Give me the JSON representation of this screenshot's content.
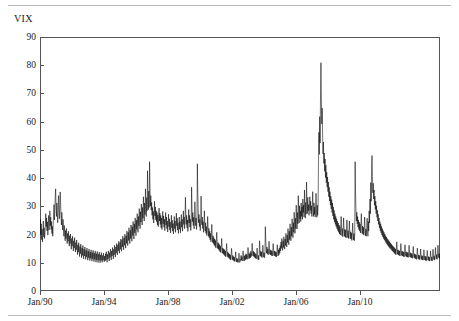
{
  "figure": {
    "series_label": "VIX",
    "line_color": "#000000",
    "frame_color": "#555555",
    "rule_color": "#b9b9b9",
    "background": "#ffffff"
  },
  "chart_data": {
    "type": "line",
    "title": "",
    "subtitle": "",
    "xlabel": "",
    "ylabel": "VIX",
    "legend": [
      "VIX"
    ],
    "legend_position": "above-left",
    "grid": false,
    "ylim": [
      0,
      90
    ],
    "y_ticks": [
      0,
      10,
      20,
      30,
      40,
      50,
      60,
      70,
      80,
      90
    ],
    "y_tick_labels": [
      "0",
      "10",
      "20",
      "30",
      "40",
      "50",
      "60",
      "70",
      "80",
      "90"
    ],
    "xlim": [
      "Jan/90",
      "Dec/14"
    ],
    "x_ticks": [
      "Jan/90",
      "Jan/94",
      "Jan/98",
      "Jan/02",
      "Jan/06",
      "Jan/10"
    ],
    "x_tick_labels": [
      "Jan/90",
      "Jan/94",
      "Jan/98",
      "Jan/02",
      "Jan/06",
      "Jan/10"
    ],
    "x_tick_fractions": [
      0.0,
      0.16,
      0.32,
      0.48,
      0.64,
      0.8
    ],
    "x_start_year": 1990,
    "x_end_year": 2015,
    "series": [
      {
        "name": "VIX",
        "color": "#000000",
        "values": [
          22.2,
          25.4,
          19.6,
          23.8,
          18.2,
          21.9,
          17.4,
          20.6,
          24.8,
          19.2,
          22.4,
          18.6,
          20.1,
          23.6,
          27.4,
          22.8,
          25.9,
          21.3,
          24.5,
          19.8,
          23.2,
          26.8,
          21.6,
          24.1,
          28.4,
          23.1,
          26.2,
          21.8,
          24.6,
          20.3,
          22.9,
          19.4,
          23.5,
          27.1,
          30.6,
          25.2,
          28.8,
          33.4,
          36.2,
          30.1,
          26.4,
          31.2,
          27.8,
          24.2,
          28.6,
          33.8,
          29.4,
          25.6,
          30.2,
          35.1,
          31.4,
          26.8,
          23.4,
          27.9,
          24.2,
          21.6,
          25.4,
          22.1,
          19.4,
          23.2,
          20.6,
          17.8,
          21.4,
          18.6,
          22.2,
          19.2,
          16.8,
          20.4,
          17.6,
          21.2,
          18.4,
          15.9,
          19.6,
          16.8,
          20.2,
          17.4,
          14.8,
          18.6,
          15.9,
          19.4,
          16.6,
          14.2,
          17.8,
          15.2,
          18.9,
          16.1,
          13.8,
          17.2,
          14.6,
          18.1,
          15.4,
          12.9,
          16.4,
          13.8,
          17.1,
          14.4,
          12.2,
          15.8,
          13.2,
          16.6,
          14.1,
          11.8,
          15.2,
          12.6,
          16.1,
          13.6,
          11.4,
          14.8,
          12.4,
          15.6,
          13.2,
          11.2,
          14.4,
          12.1,
          15.2,
          12.8,
          10.9,
          14.1,
          11.8,
          14.9,
          12.6,
          10.8,
          13.8,
          11.6,
          14.6,
          12.4,
          10.6,
          13.6,
          11.4,
          14.4,
          12.2,
          10.4,
          13.4,
          11.2,
          14.2,
          12.0,
          10.2,
          13.2,
          11.0,
          14.0,
          11.8,
          10.1,
          13.0,
          10.9,
          13.8,
          11.6,
          10.0,
          12.8,
          10.8,
          13.6,
          11.4,
          10.2,
          12.6,
          10.9,
          13.4,
          11.2,
          10.4,
          12.4,
          10.6,
          13.2,
          11.0,
          13.9,
          11.8,
          10.2,
          13.0,
          11.4,
          14.2,
          12.1,
          10.6,
          13.6,
          11.9,
          14.8,
          12.6,
          11.0,
          14.2,
          12.4,
          15.4,
          13.1,
          11.4,
          14.8,
          12.8,
          16.2,
          13.8,
          12.0,
          15.6,
          13.4,
          16.8,
          14.6,
          12.8,
          16.4,
          14.2,
          17.6,
          15.2,
          13.4,
          17.2,
          14.8,
          18.4,
          15.9,
          14.1,
          18.2,
          15.6,
          19.4,
          16.8,
          14.6,
          18.8,
          16.2,
          20.1,
          17.4,
          15.2,
          19.6,
          16.9,
          21.2,
          18.4,
          16.1,
          20.8,
          17.9,
          22.4,
          19.2,
          16.8,
          21.6,
          18.6,
          23.4,
          20.1,
          17.6,
          22.8,
          19.6,
          24.6,
          21.2,
          18.4,
          23.8,
          20.6,
          25.9,
          22.4,
          19.6,
          25.1,
          21.8,
          27.4,
          23.6,
          20.8,
          26.4,
          23.1,
          29.2,
          25.2,
          22.1,
          28.1,
          24.4,
          30.8,
          26.6,
          23.4,
          29.6,
          25.8,
          33.4,
          28.6,
          24.8,
          31.2,
          27.1,
          36.2,
          30.8,
          26.4,
          33.1,
          28.4,
          42.6,
          34.2,
          28.8,
          35.4,
          29.6,
          45.8,
          36.4,
          30.1,
          33.8,
          28.6,
          31.4,
          26.8,
          29.6,
          25.4,
          28.2,
          24.1,
          27.4,
          31.8,
          26.6,
          29.8,
          25.2,
          28.4,
          24.6,
          27.8,
          23.4,
          26.9,
          22.8,
          25.6,
          29.4,
          24.8,
          27.6,
          23.6,
          26.8,
          22.4,
          25.9,
          21.8,
          24.6,
          28.2,
          23.8,
          26.6,
          22.6,
          25.4,
          21.4,
          24.2,
          27.8,
          23.4,
          26.2,
          22.1,
          24.8,
          20.9,
          23.6,
          27.2,
          22.8,
          25.6,
          21.6,
          24.4,
          20.6,
          23.2,
          26.8,
          22.4,
          25.1,
          21.2,
          23.9,
          20.2,
          22.8,
          26.4,
          22.1,
          24.8,
          20.8,
          23.4,
          27.6,
          23.1,
          25.8,
          21.6,
          24.2,
          20.4,
          22.9,
          26.2,
          21.9,
          24.6,
          20.6,
          23.2,
          27.1,
          22.6,
          25.4,
          21.2,
          23.8,
          28.4,
          23.6,
          26.2,
          22.1,
          24.9,
          33.2,
          27.4,
          23.6,
          26.8,
          22.4,
          25.2,
          21.1,
          23.8,
          28.9,
          24.1,
          26.8,
          22.6,
          25.4,
          21.4,
          24.1,
          36.8,
          29.4,
          24.6,
          27.8,
          23.2,
          26.1,
          22.0,
          24.8,
          31.6,
          26.2,
          23.1,
          25.9,
          21.8,
          24.4,
          45.1,
          34.8,
          28.6,
          24.2,
          27.1,
          22.8,
          25.4,
          21.4,
          23.9,
          33.6,
          27.2,
          23.4,
          26.2,
          22.1,
          24.6,
          20.8,
          23.4,
          28.4,
          23.8,
          21.2,
          24.2,
          20.4,
          22.8,
          19.6,
          21.9,
          26.4,
          22.1,
          19.4,
          22.2,
          18.8,
          21.2,
          18.1,
          20.4,
          17.4,
          19.8,
          23.6,
          19.9,
          17.2,
          19.6,
          16.8,
          18.9,
          16.2,
          18.4,
          15.8,
          17.9,
          15.2,
          17.4,
          20.8,
          17.6,
          15.1,
          17.2,
          14.8,
          16.8,
          14.4,
          16.4,
          13.9,
          15.9,
          13.6,
          15.4,
          18.6,
          15.8,
          13.4,
          15.2,
          13.1,
          14.9,
          12.8,
          14.6,
          12.4,
          14.2,
          12.1,
          13.9,
          16.8,
          14.2,
          12.2,
          13.8,
          11.9,
          13.4,
          11.6,
          13.1,
          11.2,
          12.8,
          11.0,
          12.6,
          15.1,
          12.8,
          11.1,
          12.6,
          10.9,
          12.2,
          10.6,
          11.9,
          10.4,
          11.6,
          13.9,
          11.8,
          10.4,
          11.6,
          10.2,
          11.4,
          10.1,
          11.2,
          13.4,
          11.4,
          10.1,
          11.2,
          10.8,
          12.6,
          10.9,
          12.2,
          10.6,
          11.9,
          14.2,
          12.1,
          10.6,
          12.4,
          10.8,
          12.8,
          11.1,
          13.2,
          11.4,
          12.9,
          11.2,
          12.6,
          15.4,
          13.1,
          11.4,
          13.2,
          11.6,
          13.6,
          11.8,
          14.1,
          12.2,
          13.8,
          16.9,
          14.2,
          12.4,
          14.1,
          12.2,
          13.8,
          11.9,
          13.4,
          11.6,
          13.1,
          11.4,
          12.8,
          15.2,
          12.9,
          11.2,
          12.6,
          11.0,
          12.4,
          17.8,
          14.6,
          12.4,
          14.2,
          12.1,
          13.8,
          11.8,
          13.4,
          16.2,
          13.8,
          12.0,
          13.6,
          11.8,
          13.2,
          22.8,
          18.4,
          15.2,
          13.4,
          15.6,
          13.2,
          14.9,
          12.8,
          14.4,
          17.6,
          14.9,
          13.0,
          14.6,
          12.8,
          14.4,
          12.6,
          14.2,
          12.4,
          14.0,
          16.8,
          14.4,
          12.6,
          14.2,
          12.4,
          14.0,
          12.2,
          13.8,
          12.1,
          13.6,
          16.4,
          14.1,
          12.4,
          14.6,
          12.8,
          15.2,
          13.4,
          16.1,
          14.2,
          17.4,
          15.1,
          18.6,
          16.2,
          14.4,
          17.8,
          15.4,
          19.2,
          16.6,
          14.8,
          18.4,
          16.1,
          20.4,
          17.6,
          15.6,
          19.8,
          17.2,
          22.1,
          18.9,
          16.4,
          21.2,
          18.2,
          23.8,
          20.4,
          17.8,
          22.6,
          19.4,
          25.6,
          21.8,
          18.9,
          24.2,
          20.8,
          27.9,
          23.6,
          20.4,
          25.8,
          22.1,
          30.4,
          25.6,
          22.0,
          27.8,
          23.8,
          33.8,
          28.2,
          24.1,
          30.2,
          25.6,
          28.4,
          24.6,
          31.2,
          26.4,
          29.8,
          25.4,
          32.6,
          27.8,
          30.4,
          26.2,
          35.8,
          29.6,
          25.8,
          31.4,
          27.2,
          38.6,
          31.8,
          27.4,
          33.2,
          28.4,
          30.6,
          26.8,
          29.2,
          33.4,
          28.6,
          31.8,
          27.4,
          30.2,
          26.4,
          29.4,
          35.2,
          29.8,
          26.4,
          31.2,
          27.1,
          29.8,
          26.2,
          28.9,
          34.6,
          29.2,
          26.1,
          30.4,
          26.8,
          29.6,
          44.8,
          56.2,
          48.4,
          61.8,
          52.4,
          70.2,
          80.9,
          68.4,
          59.2,
          64.8,
          55.4,
          48.6,
          52.8,
          45.2,
          48.9,
          42.4,
          46.8,
          40.2,
          44.6,
          38.4,
          42.1,
          36.8,
          40.4,
          35.2,
          38.6,
          33.4,
          36.8,
          31.9,
          35.2,
          30.4,
          33.6,
          29.1,
          32.4,
          27.8,
          31.2,
          26.6,
          29.8,
          25.4,
          28.6,
          24.4,
          27.4,
          23.6,
          26.4,
          22.8,
          25.6,
          22.1,
          24.8,
          21.4,
          24.1,
          20.8,
          23.4,
          20.2,
          22.8,
          19.8,
          22.2,
          26.4,
          22.6,
          19.6,
          22.1,
          19.2,
          21.8,
          25.9,
          22.0,
          19.4,
          21.9,
          19.1,
          21.6,
          18.8,
          21.2,
          25.2,
          21.6,
          18.9,
          21.4,
          18.6,
          20.9,
          24.8,
          21.2,
          18.6,
          21.0,
          18.4,
          20.6,
          17.9,
          20.2,
          24.1,
          20.6,
          18.1,
          20.4,
          17.8,
          20.0,
          45.8,
          35.2,
          28.6,
          24.8,
          27.9,
          23.8,
          26.4,
          22.6,
          25.2,
          21.8,
          24.4,
          21.2,
          23.8,
          20.6,
          23.1,
          27.4,
          23.4,
          20.4,
          23.0,
          20.1,
          22.6,
          19.8,
          22.2,
          26.2,
          22.4,
          19.6,
          22.0,
          19.4,
          21.8,
          25.8,
          22.1,
          19.4,
          24.6,
          21.2,
          28.4,
          24.1,
          32.6,
          27.4,
          38.4,
          31.8,
          44.2,
          48.0,
          40.6,
          34.8,
          38.2,
          32.6,
          35.8,
          30.4,
          33.6,
          28.9,
          31.8,
          27.4,
          30.2,
          26.1,
          28.6,
          24.8,
          27.2,
          23.6,
          25.9,
          22.4,
          24.6,
          21.4,
          23.8,
          20.6,
          22.9,
          19.8,
          22.1,
          19.2,
          21.4,
          18.6,
          20.8,
          18.1,
          20.2,
          17.6,
          19.6,
          17.1,
          19.1,
          16.6,
          18.6,
          16.2,
          18.2,
          15.8,
          17.8,
          15.4,
          17.4,
          15.1,
          17.0,
          14.8,
          16.6,
          14.4,
          16.2,
          14.1,
          15.9,
          13.8,
          15.6,
          13.4,
          15.2,
          13.1,
          14.9,
          12.8,
          14.6,
          17.4,
          14.9,
          13.0,
          14.6,
          12.8,
          14.4,
          12.6,
          14.2,
          12.4,
          14.0,
          16.8,
          14.4,
          12.6,
          14.2,
          12.4,
          14.0,
          12.2,
          13.8,
          12.1,
          13.6,
          16.4,
          14.0,
          12.3,
          13.9,
          12.1,
          13.7,
          12.0,
          13.6,
          11.9,
          13.4,
          16.2,
          13.8,
          12.1,
          13.6,
          11.9,
          13.4,
          11.8,
          13.2,
          11.6,
          13.0,
          15.8,
          13.4,
          11.8,
          13.2,
          11.6,
          13.0,
          11.4,
          12.8,
          11.2,
          12.6,
          15.2,
          13.0,
          11.4,
          12.8,
          11.2,
          12.6,
          11.1,
          12.4,
          14.9,
          12.7,
          11.2,
          12.6,
          11.0,
          12.4,
          10.9,
          12.2,
          14.6,
          12.4,
          11.0,
          12.4,
          10.8,
          12.2,
          10.7,
          12.0,
          14.4,
          12.2,
          10.9,
          12.2,
          10.7,
          12.0,
          10.6,
          11.9,
          14.2,
          12.1,
          10.8,
          12.1,
          10.6,
          11.9,
          14.8,
          12.6,
          11.1,
          12.5,
          10.9,
          12.3,
          15.4,
          13.1,
          11.4,
          12.9,
          11.2,
          12.7,
          16.2,
          13.6,
          11.8,
          13.2,
          11.5,
          13.0
        ]
      }
    ]
  }
}
